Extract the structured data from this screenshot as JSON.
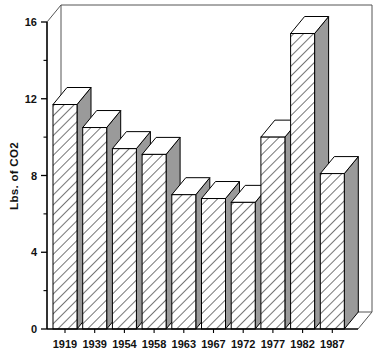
{
  "chart_data": {
    "type": "bar",
    "title": "",
    "xlabel": "",
    "ylabel": "Lbs. of CO2",
    "categories": [
      "1919",
      "1939",
      "1954",
      "1958",
      "1963",
      "1967",
      "1972",
      "1977",
      "1982",
      "1987"
    ],
    "values": [
      11.7,
      10.5,
      9.4,
      9.1,
      7.0,
      6.8,
      6.6,
      10.0,
      15.4,
      8.1
    ],
    "ylim": [
      0,
      16
    ],
    "yticks": [
      0,
      4,
      8,
      12,
      16
    ],
    "ytick_labels": [
      "0",
      "4",
      "8",
      "12",
      "16"
    ],
    "y_minor_ticks": [
      2,
      6,
      10,
      14
    ],
    "grid": false,
    "legend": null,
    "style": {
      "bar_fill": "#ffffff",
      "bar_hatch": "diagonal-forward",
      "bar_side_fill": "#9a9a9a",
      "bar_top_fill": "#ffffff",
      "outline": "#000000",
      "background": "#ffffff",
      "three_d": true
    }
  },
  "axes": {
    "y_axis_title": "Lbs. of CO2",
    "y_tick_0": "0",
    "y_tick_1": "4",
    "y_tick_2": "8",
    "y_tick_3": "12",
    "y_tick_4": "16",
    "x_tick_0": "1919",
    "x_tick_1": "1939",
    "x_tick_2": "1954",
    "x_tick_3": "1958",
    "x_tick_4": "1963",
    "x_tick_5": "1967",
    "x_tick_6": "1972",
    "x_tick_7": "1977",
    "x_tick_8": "1982",
    "x_tick_9": "1987"
  }
}
